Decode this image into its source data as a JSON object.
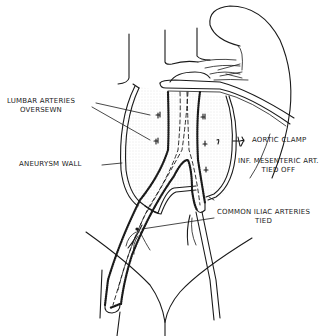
{
  "figure": {
    "labels": {
      "lumbar_arteries": {
        "line1": "LUMBAR ARTERIES",
        "line2": "OVERSEWN"
      },
      "aneurysm_wall": {
        "line1": "ANEURYSM WALL"
      },
      "aortic_clamp": {
        "line1": "AORTIC CLAMP"
      },
      "inf_mesenteric": {
        "line1": "INF. MESENTERIC ART.",
        "line2": "TIED OFF"
      },
      "common_iliac": {
        "line1": "COMMON ILIAC ARTERIES",
        "line2": "TIED"
      }
    }
  },
  "colors": {
    "ink": "#1a1a1a",
    "background": "#ffffff",
    "stipple": "#bdbdbd"
  }
}
